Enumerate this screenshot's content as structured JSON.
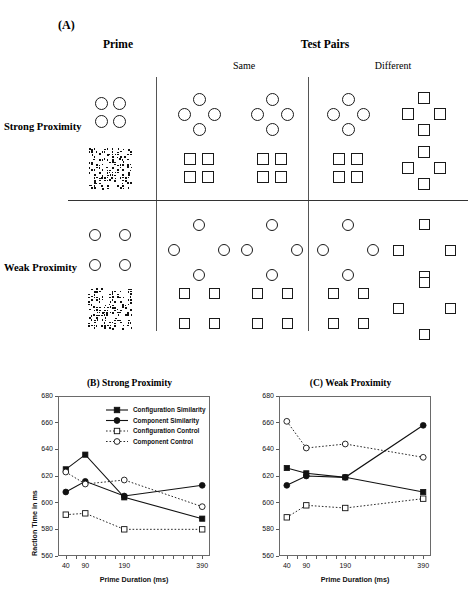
{
  "figure": {
    "panel_a_tag": "(A)",
    "col_prime": "Prime",
    "col_testpairs": "Test Pairs",
    "sub_same": "Same",
    "sub_different": "Different",
    "row_strong": "Strong Proximity",
    "row_weak": "Weak Proximity"
  },
  "stimuli": {
    "strong": {
      "prime_shape_label": "four-circles-square-arrangement",
      "prime_mask_label": "random-dot-mask",
      "same_1": "diamond-circles",
      "same_2": "diamond-circles",
      "same_3": "grid-squares",
      "same_4": "grid-squares",
      "diff_1": "diamond-circles",
      "diff_2": "diamond-squares",
      "diff_3": "grid-squares",
      "diff_4": "diamond-squares"
    },
    "weak": {
      "prime_shape_label": "four-circles-wide-square-arrangement",
      "prime_mask_label": "random-dot-mask",
      "same_1": "diamond-circles-wide",
      "same_2": "diamond-circles-wide",
      "same_3": "grid-squares-wide",
      "same_4": "grid-squares-wide",
      "diff_1": "diamond-circles-wide",
      "diff_2": "diamond-squares-wide",
      "diff_3": "grid-squares-wide",
      "diff_4": "diamond-squares-wide"
    }
  },
  "chart_data": [
    {
      "type": "line",
      "title": "(B) Strong Proximity",
      "xlabel": "Prime Duration (ms)",
      "ylabel": "Raction Time in ms",
      "x": [
        40,
        90,
        190,
        390
      ],
      "xtick_labels": [
        "40",
        "90",
        "190",
        "390"
      ],
      "xlim": [
        20,
        410
      ],
      "ylim": [
        560,
        680
      ],
      "ytick_labels": [
        "560",
        "580",
        "600",
        "620",
        "640",
        "660",
        "680"
      ],
      "yticks": [
        560,
        580,
        600,
        620,
        640,
        660,
        680
      ],
      "grid": false,
      "legend_position": "top-right",
      "series": [
        {
          "name": "Configuration Similarity",
          "values": [
            625,
            636,
            604,
            588
          ],
          "marker": "filled-square",
          "line": "solid"
        },
        {
          "name": "Component Similarity",
          "values": [
            608,
            616,
            605,
            613
          ],
          "marker": "filled-circle",
          "line": "solid"
        },
        {
          "name": "Configuration Control",
          "values": [
            591,
            592,
            580,
            580
          ],
          "marker": "open-square",
          "line": "dotted"
        },
        {
          "name": "Component Control",
          "values": [
            623,
            614,
            617,
            597
          ],
          "marker": "open-circle",
          "line": "dotted"
        }
      ]
    },
    {
      "type": "line",
      "title": "(C) Weak Proximity",
      "xlabel": "Prime Duration (ms)",
      "ylabel": "Raction Time in ms",
      "x": [
        40,
        90,
        190,
        390
      ],
      "xtick_labels": [
        "40",
        "90",
        "190",
        "390"
      ],
      "xlim": [
        20,
        410
      ],
      "ylim": [
        560,
        680
      ],
      "ytick_labels": [
        "560",
        "580",
        "600",
        "620",
        "640",
        "660",
        "680"
      ],
      "yticks": [
        560,
        580,
        600,
        620,
        640,
        660,
        680
      ],
      "grid": false,
      "legend_position": "none",
      "series": [
        {
          "name": "Configuration Similarity",
          "values": [
            626,
            622,
            619,
            608
          ],
          "marker": "filled-square",
          "line": "solid"
        },
        {
          "name": "Component Similarity",
          "values": [
            613,
            620,
            619,
            658
          ],
          "marker": "filled-circle",
          "line": "solid"
        },
        {
          "name": "Configuration Control",
          "values": [
            589,
            598,
            596,
            603
          ],
          "marker": "open-square",
          "line": "dotted"
        },
        {
          "name": "Component Control",
          "values": [
            661,
            641,
            644,
            634
          ],
          "marker": "open-circle",
          "line": "dotted"
        }
      ]
    }
  ]
}
